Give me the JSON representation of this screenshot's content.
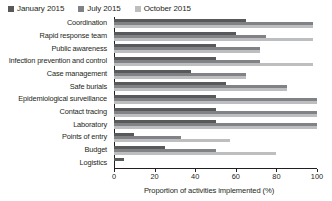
{
  "legend": {
    "position": "top-left",
    "entries": [
      {
        "label": "January 2015",
        "color": "#58595b",
        "icon": "legend-swatch"
      },
      {
        "label": "July 2015",
        "color": "#808285",
        "icon": "legend-swatch"
      },
      {
        "label": "October 2015",
        "color": "#bcbec0",
        "icon": "legend-swatch"
      }
    ]
  },
  "axis": {
    "x_ticks": [
      "0",
      "20",
      "40",
      "60",
      "80",
      "100"
    ],
    "x_title": "Proportion of activities implemented (%)"
  },
  "chart_data": {
    "type": "bar",
    "orientation": "horizontal",
    "title": "",
    "subtitle": "",
    "xlabel": "Proportion of activities implemented (%)",
    "ylabel": "",
    "xlim": [
      0,
      100
    ],
    "xticks": [
      0,
      20,
      40,
      60,
      80,
      100
    ],
    "grid": false,
    "legend_position": "top-left",
    "categories": [
      "Coordination",
      "Rapid response team",
      "Public awareness",
      "Infection prevention and control",
      "Case management",
      "Safe burials",
      "Epidemiological surveillance",
      "Contact tracing",
      "Laboratory",
      "Points of entry",
      "Budget",
      "Logistics"
    ],
    "series": [
      {
        "name": "January 2015",
        "color": "#58595b",
        "values": [
          65,
          60,
          50,
          50,
          38,
          55,
          50,
          50,
          50,
          10,
          25,
          5
        ]
      },
      {
        "name": "July 2015",
        "color": "#808285",
        "values": [
          98,
          75,
          72,
          72,
          65,
          85,
          100,
          100,
          100,
          33,
          50,
          0
        ]
      },
      {
        "name": "October 2015",
        "color": "#bcbec0",
        "values": [
          98,
          98,
          72,
          98,
          65,
          85,
          100,
          100,
          100,
          57,
          80,
          0
        ]
      }
    ]
  }
}
